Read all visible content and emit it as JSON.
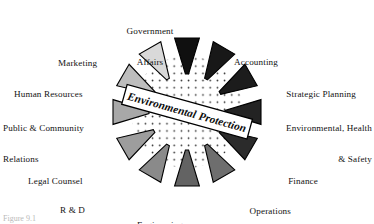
{
  "figure": {
    "center_banner": "Environmental Protection",
    "caption": "Figure 9.1",
    "colors": {
      "background": "#ffffff",
      "outline": "#000000",
      "text": "#111111",
      "stipple": "#2a2a2a"
    }
  },
  "chart_data": {
    "type": "pie",
    "title": "Environmental Protection",
    "subtitle": "",
    "xlabel": "",
    "ylabel": "",
    "legend_position": "labels-around-wedges",
    "grid": false,
    "note": "Twelve equal radial wedges (30 degrees apart) pointing inward toward a stippled center disc; each wedge is labelled with a corporate function.",
    "categories": [
      "Government Affairs",
      "Accounting",
      "Strategic Planning",
      "Environmental, Health & Safety",
      "Finance",
      "Operations",
      "Engineering",
      "R & D",
      "Legal Counsel",
      "Public & Community Relations",
      "Human Resources",
      "Marketing"
    ],
    "values": [
      1,
      1,
      1,
      1,
      1,
      1,
      1,
      1,
      1,
      1,
      1,
      1
    ],
    "slice_colors": [
      "#101010",
      "#181818",
      "#1c1c1c",
      "#232323",
      "#2b2b2b",
      "#6e6e6e",
      "#636363",
      "#8a8a8a",
      "#9d9d9d",
      "#a8a8a8",
      "#bdbdbd",
      "#d9d9d9"
    ]
  },
  "wedges": [
    {
      "id": "government-affairs",
      "label_lines": [
        "Government",
        "Affairs"
      ],
      "label_line1": "Government",
      "label_line2": "Affairs",
      "angle_deg": -90,
      "fill": "#101010",
      "align": "center",
      "label_x": 150,
      "label_y": 6
    },
    {
      "id": "accounting",
      "label_lines": [
        "Accounting"
      ],
      "label_line1": "Accounting",
      "label_line2": "",
      "angle_deg": -60,
      "fill": "#181818",
      "align": "left",
      "label_x": 224,
      "label_y": 35
    },
    {
      "id": "strategic-planning",
      "label_lines": [
        "Strategic Planning"
      ],
      "label_line1": "Strategic Planning",
      "label_line2": "",
      "angle_deg": -30,
      "fill": "#1c1c1c",
      "align": "left",
      "label_x": 258,
      "label_y": 69
    },
    {
      "id": "environmental-health-safety",
      "label_lines": [
        "Environmental, Health",
        "& Safety"
      ],
      "label_line1": "Environmental, Health",
      "label_line2": "& Safety",
      "angle_deg": 0,
      "fill": "#232323",
      "align": "left",
      "label_x": 267,
      "label_y": 105
    },
    {
      "id": "finance",
      "label_lines": [
        "Finance"
      ],
      "label_line1": "Finance",
      "label_line2": "",
      "angle_deg": 30,
      "fill": "#2b2b2b",
      "align": "left",
      "label_x": 259,
      "label_y": 155
    },
    {
      "id": "operations",
      "label_lines": [
        "Operations"
      ],
      "label_line1": "Operations",
      "label_line2": "",
      "angle_deg": 60,
      "fill": "#6e6e6e",
      "align": "left",
      "label_x": 224,
      "label_y": 185
    },
    {
      "id": "engineering",
      "label_lines": [
        "Engineering"
      ],
      "label_line1": "Engineering",
      "label_line2": "",
      "angle_deg": 90,
      "fill": "#636363",
      "align": "center",
      "label_x": 157,
      "label_y": 198
    },
    {
      "id": "r-and-d",
      "label_lines": [
        "R & D"
      ],
      "label_line1": "R & D",
      "label_line2": "",
      "angle_deg": 120,
      "fill": "#8a8a8a",
      "align": "right",
      "label_x": 104,
      "label_y": 184
    },
    {
      "id": "legal-counsel",
      "label_lines": [
        "Legal Counsel"
      ],
      "label_line1": "Legal Counsel",
      "label_line2": "",
      "angle_deg": 150,
      "fill": "#9d9d9d",
      "align": "right",
      "label_x": 52,
      "label_y": 154
    },
    {
      "id": "public-community-relations",
      "label_lines": [
        "Public & Community",
        "Relations"
      ],
      "label_line1": "Public & Community",
      "label_line2": "Relations",
      "angle_deg": 180,
      "fill": "#a8a8a8",
      "align": "right",
      "label_x": 12,
      "label_y": 105
    },
    {
      "id": "human-resources",
      "label_lines": [
        "Human Resources"
      ],
      "label_line1": "Human Resources",
      "label_line2": "",
      "angle_deg": 210,
      "fill": "#bdbdbd",
      "align": "right",
      "label_x": 30,
      "label_y": 69
    },
    {
      "id": "marketing",
      "label_lines": [
        "Marketing"
      ],
      "label_line1": "Marketing",
      "label_line2": "",
      "angle_deg": 240,
      "fill": "#d9d9d9",
      "align": "right",
      "label_x": 93,
      "label_y": 36
    }
  ]
}
